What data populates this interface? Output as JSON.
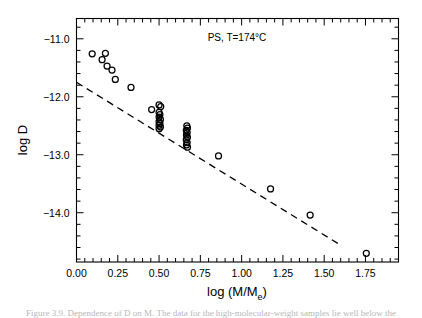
{
  "figure": {
    "annotation": "PS, T=174°C",
    "caption_partial": "Figure 3.9.  Dependence of D on M. The data for the high-molecular-weight samples lie well below the"
  },
  "chart_data": {
    "type": "scatter",
    "title": "",
    "annotation": "PS, T=174°C",
    "xlabel": "log (M/M",
    "xlabel_sub": "e",
    "xlabel_tail": ")",
    "ylabel": "log D",
    "xlim": [
      0.0,
      1.95
    ],
    "ylim": [
      -14.85,
      -10.65
    ],
    "xticks": [
      0.0,
      0.25,
      0.5,
      0.75,
      1.0,
      1.25,
      1.5,
      1.75
    ],
    "xticklabels": [
      "0.00",
      "0.25",
      "0.50",
      "0.75",
      "1.00",
      "1.25",
      "1.50",
      "1.75"
    ],
    "yticks": [
      -11.0,
      -12.0,
      -13.0,
      -14.0
    ],
    "yticklabels": [
      "−11.0",
      "−12.0",
      "−13.0",
      "−14.0"
    ],
    "minor_ticks_per_interval": 5,
    "grid": false,
    "legend": "none",
    "marker": "open-circle",
    "marker_size_px": 4.2,
    "series": [
      {
        "name": "diffusion data",
        "points": [
          [
            0.095,
            -11.26
          ],
          [
            0.175,
            -11.25
          ],
          [
            0.155,
            -11.36
          ],
          [
            0.185,
            -11.47
          ],
          [
            0.215,
            -11.54
          ],
          [
            0.235,
            -11.7
          ],
          [
            0.33,
            -11.84
          ],
          [
            0.455,
            -12.22
          ],
          [
            0.5,
            -12.14
          ],
          [
            0.51,
            -12.17
          ],
          [
            0.5,
            -12.27
          ],
          [
            0.505,
            -12.31
          ],
          [
            0.5,
            -12.35
          ],
          [
            0.508,
            -12.39
          ],
          [
            0.5,
            -12.43
          ],
          [
            0.505,
            -12.46
          ],
          [
            0.5,
            -12.49
          ],
          [
            0.508,
            -12.52
          ],
          [
            0.5,
            -12.55
          ],
          [
            0.668,
            -12.5
          ],
          [
            0.672,
            -12.54
          ],
          [
            0.665,
            -12.58
          ],
          [
            0.67,
            -12.62
          ],
          [
            0.666,
            -12.66
          ],
          [
            0.672,
            -12.7
          ],
          [
            0.665,
            -12.74
          ],
          [
            0.67,
            -12.79
          ],
          [
            0.666,
            -12.83
          ],
          [
            0.672,
            -12.87
          ],
          [
            0.86,
            -13.02
          ],
          [
            1.175,
            -13.59
          ],
          [
            1.415,
            -14.04
          ],
          [
            1.755,
            -14.7
          ]
        ]
      }
    ],
    "fit_line": {
      "style": "dashed",
      "x": [
        0.0,
        1.6
      ],
      "y": [
        -11.75,
        -14.56
      ],
      "slope": -1.756,
      "intercept": -11.75
    }
  }
}
